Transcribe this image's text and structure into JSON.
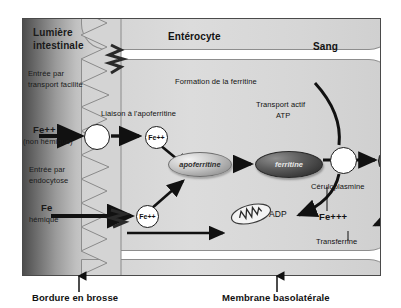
{
  "diagram": {
    "regions": {
      "lumen_line1": "Lumière",
      "lumen_line2": "intestinale",
      "enterocyte": "Entérocyte",
      "blood": "Sang"
    },
    "pathways": {
      "facilitated_line1": "Entrée par",
      "facilitated_line2": "transport facilité",
      "endocytosis_line1": "Entrée par",
      "endocytosis_line2": "endocytose",
      "binding": "Liaison à l'apoferritine",
      "formation": "Formation de la ferritine",
      "active_transport_line1": "Transport actif",
      "active_transport_line2": "ATP"
    },
    "species": {
      "fe2_nonheme_line1": "Fe++",
      "fe2_nonheme_line2": "(non hémique)",
      "fe_heme_line1": "Fe",
      "fe_heme_line2": "hémique",
      "fe2_carrier": "Fe++",
      "fe2_endocytosed": "Fe++",
      "fe2_blood": "Fe++",
      "fe3_blood": "Fe+++",
      "apoferritine": "apoferritine",
      "ferritine": "ferritine",
      "adp": "ADP",
      "ceruloplasmine": "Céruloplasmine",
      "transferrine": "Transferrine"
    },
    "captions": {
      "brush_border": "Bordure en brosse",
      "basolateral": "Membrane basolatérale"
    },
    "colors": {
      "lumen_dark": "#4d4d4d",
      "cell_fill": "#d6d6d6",
      "ferritine_dark": "#3a3a3a",
      "outline": "#1a1a1a"
    }
  }
}
